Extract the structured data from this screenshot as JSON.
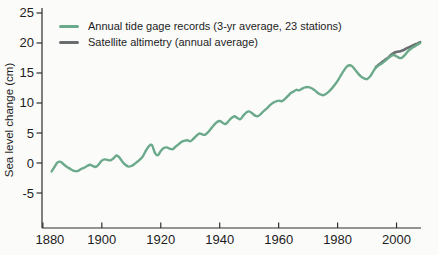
{
  "figure": {
    "background": "#fbfbfa"
  },
  "chart_data": {
    "type": "line",
    "title": "",
    "xlabel": "",
    "ylabel": "Sea level change (cm)",
    "xlim": [
      1879.7,
      2008.3
    ],
    "ylim": [
      -10.83,
      25.83
    ],
    "x_ticks": [
      1880,
      1900,
      1920,
      1940,
      1960,
      1980,
      2000
    ],
    "y_ticks": [
      25,
      20,
      15,
      10,
      5,
      0,
      -5
    ],
    "grid": false,
    "legend_position": "top-left",
    "axis_color": "#2e2e2e",
    "layout": {
      "plot": {
        "left": 42,
        "right": 421,
        "top": 8,
        "bottom": 228
      },
      "tick_len": 5.5,
      "first_x_label_dx": 7,
      "draw_order": [
        1,
        0
      ]
    },
    "series": [
      {
        "name": "Annual tide gage records (3-yr average, 23 stations)",
        "color": "#6aa98a",
        "width": 2.4,
        "points": [
          [
            1883,
            -1.4
          ],
          [
            1884,
            -0.6
          ],
          [
            1885,
            0.1
          ],
          [
            1886,
            0.2
          ],
          [
            1887,
            -0.2
          ],
          [
            1888,
            -0.6
          ],
          [
            1889,
            -0.9
          ],
          [
            1890,
            -1.2
          ],
          [
            1891,
            -1.35
          ],
          [
            1892,
            -1.3
          ],
          [
            1893,
            -1.0
          ],
          [
            1894,
            -0.8
          ],
          [
            1895,
            -0.5
          ],
          [
            1896,
            -0.3
          ],
          [
            1897,
            -0.5
          ],
          [
            1898,
            -0.65
          ],
          [
            1899,
            -0.2
          ],
          [
            1900,
            0.4
          ],
          [
            1901,
            0.6
          ],
          [
            1902,
            0.5
          ],
          [
            1903,
            0.45
          ],
          [
            1904,
            0.8
          ],
          [
            1905,
            1.25
          ],
          [
            1906,
            0.9
          ],
          [
            1907,
            0.2
          ],
          [
            1908,
            -0.3
          ],
          [
            1909,
            -0.6
          ],
          [
            1910,
            -0.5
          ],
          [
            1911,
            -0.2
          ],
          [
            1912,
            0.2
          ],
          [
            1913,
            0.6
          ],
          [
            1914,
            1.2
          ],
          [
            1915,
            2.1
          ],
          [
            1916,
            2.8
          ],
          [
            1917,
            3.0
          ],
          [
            1918,
            1.7
          ],
          [
            1919,
            1.3
          ],
          [
            1920,
            2.0
          ],
          [
            1921,
            2.5
          ],
          [
            1922,
            2.6
          ],
          [
            1923,
            2.4
          ],
          [
            1924,
            2.3
          ],
          [
            1925,
            2.7
          ],
          [
            1926,
            3.1
          ],
          [
            1927,
            3.5
          ],
          [
            1928,
            3.7
          ],
          [
            1929,
            3.8
          ],
          [
            1930,
            3.6
          ],
          [
            1931,
            4.0
          ],
          [
            1932,
            4.5
          ],
          [
            1933,
            4.9
          ],
          [
            1934,
            4.8
          ],
          [
            1935,
            4.7
          ],
          [
            1936,
            5.1
          ],
          [
            1937,
            5.7
          ],
          [
            1938,
            6.3
          ],
          [
            1939,
            6.8
          ],
          [
            1940,
            7.0
          ],
          [
            1941,
            6.7
          ],
          [
            1942,
            6.5
          ],
          [
            1943,
            7.0
          ],
          [
            1944,
            7.5
          ],
          [
            1945,
            7.8
          ],
          [
            1946,
            7.5
          ],
          [
            1947,
            7.3
          ],
          [
            1948,
            7.9
          ],
          [
            1949,
            8.4
          ],
          [
            1950,
            8.6
          ],
          [
            1951,
            8.3
          ],
          [
            1952,
            7.9
          ],
          [
            1953,
            7.8
          ],
          [
            1954,
            8.2
          ],
          [
            1955,
            8.7
          ],
          [
            1956,
            9.1
          ],
          [
            1957,
            9.6
          ],
          [
            1958,
            10.0
          ],
          [
            1959,
            10.25
          ],
          [
            1960,
            10.4
          ],
          [
            1961,
            10.3
          ],
          [
            1962,
            10.6
          ],
          [
            1963,
            11.1
          ],
          [
            1964,
            11.6
          ],
          [
            1965,
            11.9
          ],
          [
            1966,
            12.2
          ],
          [
            1967,
            12.1
          ],
          [
            1968,
            12.4
          ],
          [
            1969,
            12.6
          ],
          [
            1970,
            12.65
          ],
          [
            1971,
            12.5
          ],
          [
            1972,
            12.2
          ],
          [
            1973,
            11.8
          ],
          [
            1974,
            11.45
          ],
          [
            1975,
            11.3
          ],
          [
            1976,
            11.5
          ],
          [
            1977,
            11.9
          ],
          [
            1978,
            12.4
          ],
          [
            1979,
            13.0
          ],
          [
            1980,
            13.7
          ],
          [
            1981,
            14.5
          ],
          [
            1982,
            15.3
          ],
          [
            1983,
            16.0
          ],
          [
            1984,
            16.3
          ],
          [
            1985,
            16.1
          ],
          [
            1986,
            15.5
          ],
          [
            1987,
            14.9
          ],
          [
            1988,
            14.4
          ],
          [
            1989,
            14.1
          ],
          [
            1990,
            14.0
          ],
          [
            1991,
            14.4
          ],
          [
            1992,
            15.2
          ],
          [
            1993,
            15.9
          ],
          [
            1994,
            16.3
          ],
          [
            1995,
            16.6
          ],
          [
            1996,
            17.0
          ],
          [
            1997,
            17.4
          ],
          [
            1998,
            17.8
          ],
          [
            1999,
            18.0
          ],
          [
            2000,
            17.8
          ],
          [
            2001,
            17.5
          ],
          [
            2002,
            17.6
          ],
          [
            2003,
            18.1
          ],
          [
            2004,
            18.7
          ],
          [
            2005,
            19.1
          ],
          [
            2006,
            19.4
          ],
          [
            2007,
            19.7
          ],
          [
            2008,
            20.0
          ]
        ]
      },
      {
        "name": "Satellite altimetry (annual average)",
        "color": "#6a6d6f",
        "width": 2.6,
        "points": [
          [
            1993,
            16.0
          ],
          [
            1994,
            16.4
          ],
          [
            1995,
            16.8
          ],
          [
            1996,
            17.15
          ],
          [
            1997,
            17.5
          ],
          [
            1998,
            17.95
          ],
          [
            1999,
            18.3
          ],
          [
            2000,
            18.5
          ],
          [
            2001,
            18.6
          ],
          [
            2002,
            18.75
          ],
          [
            2003,
            19.0
          ],
          [
            2004,
            19.25
          ],
          [
            2005,
            19.45
          ],
          [
            2006,
            19.7
          ],
          [
            2007,
            19.9
          ],
          [
            2008,
            20.15
          ]
        ]
      }
    ]
  }
}
